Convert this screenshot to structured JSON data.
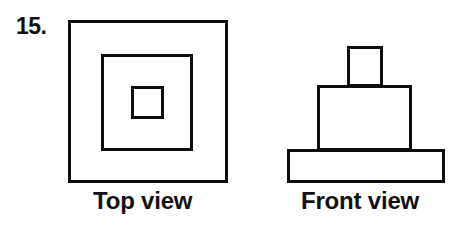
{
  "figure": {
    "problem_number": "15.",
    "background_color": "#ffffff",
    "line_color": "#0d0d0d",
    "text_color": "#111111"
  },
  "views": [
    {
      "id": "top-view",
      "caption": "Top view",
      "description": "three concentric squares",
      "shapes": [
        {
          "name": "outer-square",
          "x": 68,
          "y": 20,
          "width": 160,
          "height": 163,
          "stroke": 3
        },
        {
          "name": "middle-square",
          "x": 101,
          "y": 54,
          "width": 92,
          "height": 97,
          "stroke": 3
        },
        {
          "name": "inner-square",
          "x": 131,
          "y": 86,
          "width": 33,
          "height": 33,
          "stroke": 3
        }
      ]
    },
    {
      "id": "front-view",
      "caption": "Front view",
      "description": "three stacked rectangles forming a stepped tower",
      "shapes": [
        {
          "name": "top-rectangle",
          "x": 347,
          "y": 46,
          "width": 36,
          "height": 41,
          "stroke": 3
        },
        {
          "name": "middle-rectangle",
          "x": 317,
          "y": 85,
          "width": 95,
          "height": 66,
          "stroke": 3
        },
        {
          "name": "base-rectangle",
          "x": 287,
          "y": 149,
          "width": 158,
          "height": 34,
          "stroke": 3
        }
      ]
    }
  ]
}
